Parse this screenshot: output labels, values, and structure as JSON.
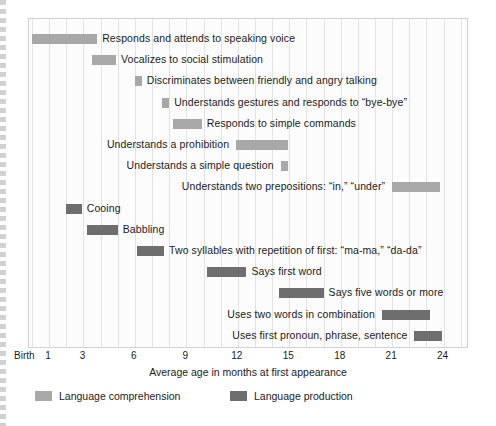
{
  "chart_data": {
    "type": "bar",
    "subtype": "horizontal-range-gantt",
    "title": "",
    "xlabel": "Average age in months at first appearance",
    "ylabel": "",
    "xlim": [
      0,
      25
    ],
    "xticks": [
      {
        "value": 0,
        "label": "Birth"
      },
      {
        "value": 1,
        "label": "1"
      },
      {
        "value": 3,
        "label": "3"
      },
      {
        "value": 6,
        "label": "6"
      },
      {
        "value": 9,
        "label": "9"
      },
      {
        "value": 12,
        "label": "12"
      },
      {
        "value": 15,
        "label": "15"
      },
      {
        "value": 18,
        "label": "18"
      },
      {
        "value": 21,
        "label": "21"
      },
      {
        "value": 24,
        "label": "24"
      }
    ],
    "grid": "vertical, every 1 month",
    "legend_position": "bottom-left",
    "series": [
      {
        "name": "Language comprehension",
        "color": "#a8a8a8",
        "key": "comp"
      },
      {
        "name": "Language production",
        "color": "#6e6e6e",
        "key": "prod"
      }
    ],
    "bars": [
      {
        "label": "Responds and attends to speaking voice",
        "series": "comp",
        "start": 0,
        "end": 3.8,
        "label_side": "right"
      },
      {
        "label": "Vocalizes to social stimulation",
        "series": "comp",
        "start": 3.5,
        "end": 4.9,
        "label_side": "right"
      },
      {
        "label": "Discriminates between friendly and angry talking",
        "series": "comp",
        "start": 6.0,
        "end": 6.4,
        "label_side": "right"
      },
      {
        "label": "Understands gestures and responds to “bye-bye”",
        "series": "comp",
        "start": 7.6,
        "end": 8.0,
        "label_side": "right"
      },
      {
        "label": "Responds to simple commands",
        "series": "comp",
        "start": 8.2,
        "end": 9.9,
        "label_side": "right"
      },
      {
        "label": "Understands a prohibition",
        "series": "comp",
        "start": 11.9,
        "end": 14.9,
        "label_side": "left"
      },
      {
        "label": "Understands a simple question",
        "series": "comp",
        "start": 14.5,
        "end": 14.9,
        "label_side": "left"
      },
      {
        "label": "Understands two prepositions: “in,” “under”",
        "series": "comp",
        "start": 21.0,
        "end": 23.8,
        "label_side": "left"
      },
      {
        "label": "Cooing",
        "series": "prod",
        "start": 2.0,
        "end": 2.9,
        "label_side": "right"
      },
      {
        "label": "Babbling",
        "series": "prod",
        "start": 3.2,
        "end": 5.0,
        "label_side": "right"
      },
      {
        "label": "Two syllables with repetition of first: “ma-ma,” “da-da”",
        "series": "prod",
        "start": 6.1,
        "end": 7.7,
        "label_side": "right"
      },
      {
        "label": "Says first word",
        "series": "prod",
        "start": 10.2,
        "end": 12.5,
        "label_side": "right"
      },
      {
        "label": "Says five words or more",
        "series": "prod",
        "start": 14.4,
        "end": 17.0,
        "label_side": "right"
      },
      {
        "label": "Uses two words in combination",
        "series": "prod",
        "start": 20.4,
        "end": 23.2,
        "label_side": "left"
      },
      {
        "label": "Uses first pronoun, phrase, sentence",
        "series": "prod",
        "start": 22.3,
        "end": 23.9,
        "label_side": "left"
      }
    ]
  },
  "legend": {
    "items": [
      {
        "label": "Language comprehension",
        "key": "comp"
      },
      {
        "label": "Language production",
        "key": "prod"
      }
    ]
  }
}
